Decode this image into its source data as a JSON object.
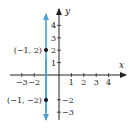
{
  "chart_data": {
    "type": "line",
    "title": "",
    "xlabel": "x",
    "ylabel": "y",
    "xlim": [
      -3.5,
      5.5
    ],
    "ylim": [
      -3.6,
      5.4
    ],
    "grid": false,
    "x_ticks": [
      -3,
      -2,
      1,
      2,
      3,
      4
    ],
    "x_tick_labels": [
      "−3",
      "−2",
      "1",
      "2",
      "3",
      "4"
    ],
    "y_ticks": [
      4,
      3,
      2,
      1,
      -2,
      -3
    ],
    "y_tick_labels": [
      "4",
      "3",
      "2",
      "1",
      "−2",
      "−3"
    ],
    "series": [
      {
        "name": "x = -1",
        "kind": "vertical-line",
        "x": [
          -1,
          -1
        ],
        "y": [
          -3.6,
          5.4
        ],
        "color": "#4a9fd4",
        "arrows": "both"
      }
    ],
    "points": [
      {
        "x": -1,
        "y": 2,
        "label": "(−1, 2)"
      },
      {
        "x": -1,
        "y": -2,
        "label": "(−1, −2)"
      }
    ]
  },
  "colors": {
    "line": "#4a9fd4",
    "axis": "#222222",
    "point": "#111111"
  }
}
